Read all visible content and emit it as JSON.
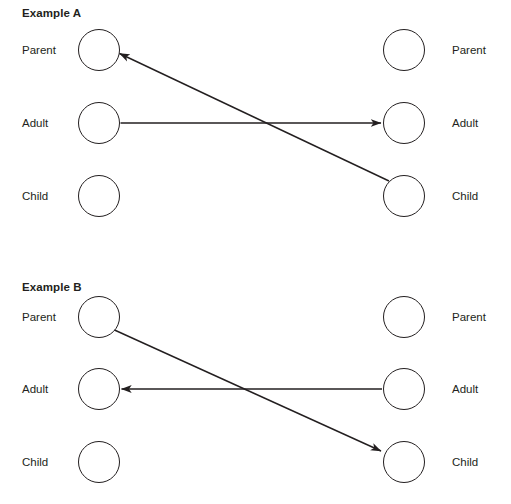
{
  "page": {
    "background_color": "#ffffff",
    "stroke_color": "#231f20",
    "width": 511,
    "height": 504
  },
  "examples": [
    {
      "id": "example-a",
      "title": "Example A",
      "left_column": {
        "nodes": [
          {
            "label": "Parent",
            "cy": 50
          },
          {
            "label": "Adult",
            "cy": 123
          },
          {
            "label": "Child",
            "cy": 196
          }
        ]
      },
      "right_column": {
        "nodes": [
          {
            "label": "Parent",
            "cy": 50
          },
          {
            "label": "Adult",
            "cy": 123
          },
          {
            "label": "Child",
            "cy": 196
          }
        ]
      },
      "arrows": [
        {
          "name": "arrow-left-adult-to-right-adult",
          "from": "left.Adult",
          "to": "right.Adult",
          "kind": "horizontal"
        },
        {
          "name": "arrow-right-child-to-left-parent",
          "from": "right.Child",
          "to": "left.Parent",
          "kind": "crossed"
        }
      ]
    },
    {
      "id": "example-b",
      "title": "Example B",
      "left_column": {
        "nodes": [
          {
            "label": "Parent",
            "cy": 55
          },
          {
            "label": "Adult",
            "cy": 127
          },
          {
            "label": "Child",
            "cy": 200
          }
        ]
      },
      "right_column": {
        "nodes": [
          {
            "label": "Parent",
            "cy": 55
          },
          {
            "label": "Adult",
            "cy": 127
          },
          {
            "label": "Child",
            "cy": 200
          }
        ]
      },
      "arrows": [
        {
          "name": "arrow-right-adult-to-left-adult",
          "from": "right.Adult",
          "to": "left.Adult",
          "kind": "horizontal"
        },
        {
          "name": "arrow-left-parent-to-right-child",
          "from": "left.Parent",
          "to": "right.Child",
          "kind": "crossed"
        }
      ]
    }
  ]
}
